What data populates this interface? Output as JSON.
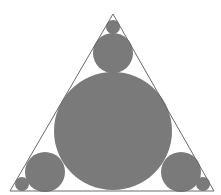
{
  "diagram": {
    "colors": {
      "background": "#ffffff",
      "triangle_stroke": "#6a6a6a",
      "circle_fill": "#7a7a7a"
    },
    "triangle": {
      "points": [
        [
          113,
          14
        ],
        [
          10,
          191
        ],
        [
          214,
          191
        ]
      ]
    },
    "circles": [
      {
        "name": "large-center-circle",
        "cx": 113,
        "cy": 131,
        "r": 59
      },
      {
        "name": "top-medium-circle",
        "cx": 113,
        "cy": 53,
        "r": 20
      },
      {
        "name": "top-small-circle",
        "cx": 113,
        "cy": 27,
        "r": 7
      },
      {
        "name": "bottom-left-medium-circle",
        "cx": 45,
        "cy": 172,
        "r": 20
      },
      {
        "name": "bottom-left-small-circle",
        "cx": 22,
        "cy": 184,
        "r": 7
      },
      {
        "name": "bottom-right-medium-circle",
        "cx": 181,
        "cy": 172,
        "r": 20
      },
      {
        "name": "bottom-right-small-circle",
        "cx": 203,
        "cy": 184,
        "r": 7
      }
    ]
  }
}
